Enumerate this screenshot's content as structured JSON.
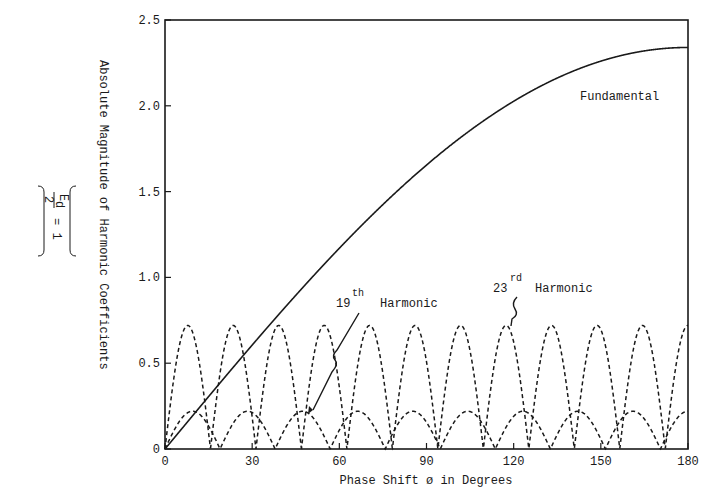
{
  "chart_data": {
    "type": "line",
    "title": "",
    "xlabel": "Phase Shift ø in Degrees",
    "ylabel": "Absolute Magnitude of Harmonic Coefficients",
    "ylabel_note": {
      "numerator": "E",
      "subscript": "d",
      "denominator": "2",
      "equals": "= 1"
    },
    "xlim": [
      0,
      180
    ],
    "ylim": [
      0,
      2.5
    ],
    "x_ticks": [
      0,
      30,
      60,
      90,
      120,
      150,
      180
    ],
    "x_tick_labels": [
      "0",
      "30",
      "60",
      "90",
      "120",
      "150",
      "180"
    ],
    "y_ticks": [
      0,
      0.5,
      1.0,
      1.5,
      2.0,
      2.5
    ],
    "y_tick_labels": [
      "0",
      "0.5",
      "1.0",
      "1.5",
      "2.0",
      "2.5"
    ],
    "grid": false,
    "legend": null,
    "series": [
      {
        "name": "Fundamental",
        "style": "solid",
        "formula": "2.34*|sin(phi/2)|",
        "x": [
          0,
          15,
          30,
          45,
          60,
          75,
          90,
          105,
          120,
          135,
          150,
          165,
          180
        ],
        "values": [
          0,
          0.31,
          0.61,
          0.9,
          1.17,
          1.42,
          1.65,
          1.86,
          2.03,
          2.16,
          2.26,
          2.32,
          2.34
        ]
      },
      {
        "name": "19th Harmonic",
        "style": "dashed",
        "formula": "0.22*|sin(19*phi/2)|",
        "peak": 0.22,
        "zeros_deg": [
          0,
          18.9,
          37.9,
          56.8,
          75.8,
          94.7,
          113.7,
          132.6,
          151.6,
          170.5
        ]
      },
      {
        "name": "23rd Harmonic",
        "style": "dashed",
        "formula": "0.72*|sin(23*phi/2)|",
        "peak": 0.72,
        "zeros_deg": [
          0,
          15.7,
          31.3,
          47.0,
          62.6,
          78.3,
          93.9,
          109.6,
          125.2,
          140.9,
          156.5,
          172.2
        ]
      }
    ],
    "annotations": [
      {
        "text": "Fundamental",
        "x_deg": 115,
        "y": 2.03
      },
      {
        "text": "19",
        "sup": "th",
        "suffix": "Harmonic",
        "arrow_to_deg": 50,
        "arrow_to_y": 0.21
      },
      {
        "text": "23",
        "sup": "rd",
        "suffix": "Harmonic",
        "arrow_to_deg": 118,
        "arrow_to_y": 0.72
      }
    ]
  },
  "labels": {
    "fundamental": "Fundamental",
    "h19_num": "19",
    "h19_sup": "th",
    "h23_num": "23",
    "h23_sup": "rd",
    "harmonic": "Harmonic"
  }
}
